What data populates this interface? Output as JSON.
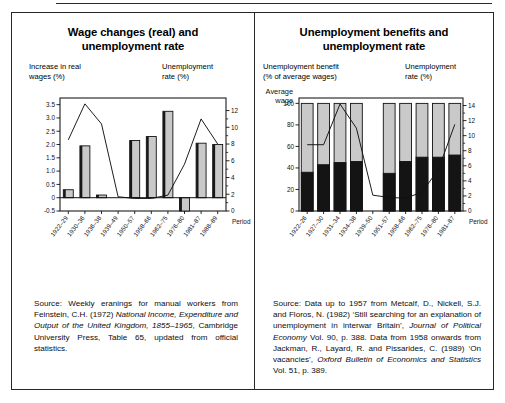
{
  "figure": {
    "background": "#ffffff",
    "frame_color": "#262626"
  },
  "left_panel": {
    "title_line1": "Wage changes (real) and",
    "title_line2": "unemployment rate",
    "left_axis_caption_line1": "Increase in real",
    "left_axis_caption_line2": "wages (%)",
    "right_axis_caption_line1": "Unemployment",
    "right_axis_caption_line2": "rate (%)",
    "period_label": "Period",
    "source_plain_1": "Source: Weekly eranings for manual workers from Feinstein, C.H. (1972) ",
    "source_italic_1": "National Income, Expenditure and Output of the United Kingdom, 1855–1965",
    "source_plain_2": ", Cambridge University Press, Table 65, updated from official statistics."
  },
  "right_panel": {
    "title_line1": "Unemployment benefits and",
    "title_line2": "unemployment rate",
    "left_axis_caption_line1": "Unemployment benefit",
    "left_axis_caption_line2": "(% of average wages)",
    "right_axis_caption_line1": "Unemployment",
    "right_axis_caption_line2": "rate (%)",
    "average_wage_label_line1": "Average",
    "average_wage_label_line2": "wage",
    "period_label": "Period",
    "source_plain_1": "Source: Data up to 1957 from Metcalf, D., Nickell, S.J. and Floros, N. (1982) ‘Still searching for an explanation of unemployment in interwar Britain’, ",
    "source_italic_1": "Journal of Political Economy",
    "source_plain_2": " Vol. 90, p. 388. Data from 1958 onwards from Jackman, R., Layard, R. and Pissarides, C. (1989) ‘On vacancies’, ",
    "source_italic_2": "Oxford Bulletin of Economics and Statistics",
    "source_plain_3": " Vol. 51, p. 389."
  },
  "chart_data": [
    {
      "id": "wage-changes-chart",
      "type": "bar",
      "title": "Wage changes (real) and unemployment rate",
      "xlabel": "Period",
      "ylabel": "Increase in real wages (%)",
      "y2label": "Unemployment rate (%)",
      "grid": false,
      "legend": "none",
      "categories": [
        "1922–29",
        "1930–36",
        "1936–38",
        "1939–49",
        "1950–57",
        "1958–66",
        "1962–75",
        "1976–80",
        "1981–87",
        "1988–89"
      ],
      "ylim": [
        -0.5,
        3.75
      ],
      "yticks": [
        "3.5",
        "3.0",
        "2.5",
        "2.0",
        "1.5",
        "1.0",
        "0.5",
        "0",
        "-0.5"
      ],
      "ytickvalues": [
        3.5,
        3.0,
        2.5,
        2.0,
        1.5,
        1.0,
        0.5,
        0,
        -0.5
      ],
      "y2lim": [
        0,
        13.5
      ],
      "y2ticks": [
        "12",
        "10",
        "8",
        "6",
        "4",
        "2",
        "0"
      ],
      "y2tickvalues": [
        12,
        10,
        8,
        6,
        4,
        2,
        0
      ],
      "series": [
        {
          "name": "Increase in real wages (%)",
          "kind": "bar",
          "color": "#c9c9c9",
          "edge": "#111111",
          "axis": "left",
          "values": [
            0.3,
            1.95,
            0.1,
            0.0,
            2.15,
            2.3,
            3.25,
            -0.5,
            2.05,
            2.0
          ]
        },
        {
          "name": "Unemployment rate (%)",
          "kind": "line",
          "color": "#111111",
          "axis": "right",
          "values": [
            8.5,
            12.8,
            10.4,
            1.7,
            1.5,
            1.5,
            1.9,
            5.6,
            11.0,
            8.0
          ]
        }
      ]
    },
    {
      "id": "unemployment-benefits-chart",
      "type": "bar",
      "title": "Unemployment benefits and unemployment rate",
      "xlabel": "Period",
      "ylabel": "Unemployment benefit (% of average wages)",
      "y2label": "Unemployment rate (%)",
      "grid": false,
      "legend": "none",
      "stacked": true,
      "categories": [
        "1922–26",
        "1927–30",
        "1931–34",
        "1934–38",
        "1939–50",
        "1951–57",
        "1958–66",
        "1962–75",
        "1976–80",
        "1981–87"
      ],
      "ylim": [
        0,
        105
      ],
      "yticks": [
        "100",
        "80",
        "60",
        "40",
        "20",
        "0"
      ],
      "ytickvalues": [
        100,
        80,
        60,
        40,
        20,
        0
      ],
      "y2lim": [
        0,
        15
      ],
      "y2ticks": [
        "14",
        "12",
        "10",
        "8",
        "6",
        "4",
        "2",
        "0"
      ],
      "y2tickvalues": [
        14,
        12,
        10,
        8,
        6,
        4,
        2,
        0
      ],
      "series": [
        {
          "name": "Unemployment benefit (% of average wages)",
          "kind": "bar",
          "color": "#141414",
          "edge": "#111111",
          "axis": "left",
          "values": [
            36,
            43,
            45,
            46,
            null,
            35,
            46,
            50,
            50,
            52
          ]
        },
        {
          "name": "Average wage remainder",
          "kind": "bar",
          "color": "#c9c9c9",
          "edge": "#111111",
          "axis": "left",
          "values": [
            100,
            100,
            100,
            100,
            null,
            100,
            100,
            100,
            100,
            100
          ]
        },
        {
          "name": "Unemployment rate (%)",
          "kind": "line",
          "color": "#111111",
          "axis": "right",
          "values": [
            8.8,
            8.8,
            14.2,
            11.0,
            2.1,
            1.8,
            1.7,
            2.5,
            5.5,
            11.5
          ]
        }
      ]
    }
  ]
}
